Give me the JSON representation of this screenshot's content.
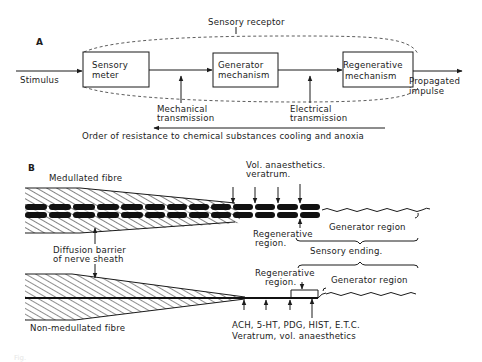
{
  "figure": {
    "panel_a": {
      "label": "A",
      "title": "Sensory receptor",
      "input": "Stimulus",
      "boxes": [
        {
          "line1": "Sensory",
          "line2": "meter"
        },
        {
          "line1": "Generator",
          "line2": "mechanism"
        },
        {
          "line1": "Regenerative",
          "line2": "mechanism"
        }
      ],
      "output": {
        "line1": "Propagated",
        "line2": "impulse"
      },
      "transmissions": [
        {
          "line1": "Mechanical",
          "line2": "transmission"
        },
        {
          "line1": "Electrical",
          "line2": "transmission"
        }
      ],
      "resistance_note": "Order of resistance to chemical substances cooling and anoxia"
    },
    "panel_b": {
      "label": "B",
      "medullated": {
        "fibre_label": "Medullated fibre",
        "agents": {
          "line1": "Vol. anaesthetics.",
          "line2": "veratrum."
        },
        "regenerative": {
          "line1": "Regenerative",
          "line2": "region."
        },
        "generator": "Generator region"
      },
      "barrier": {
        "line1": "Diffusion barrier",
        "line2": "of nerve sheath"
      },
      "sensory_ending": "Sensory ending.",
      "non_medullated": {
        "fibre_label": "Non-medullated fibre",
        "regenerative": {
          "line1": "Regenerative",
          "line2": "region."
        },
        "generator": "Generator region",
        "agents": {
          "line1": "ACH, 5-HT, PDG, HIST, E.T.C.",
          "line2": "Veratrum, vol. anaesthetics"
        }
      }
    },
    "caption_faint": "Fig."
  }
}
